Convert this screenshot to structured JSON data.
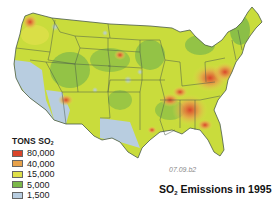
{
  "legend": {
    "title_prefix": "TONS SO",
    "title_sub": "2",
    "items": [
      {
        "label": "80,000",
        "color": "#d9452a"
      },
      {
        "label": "40,000",
        "color": "#e8a24a"
      },
      {
        "label": "15,000",
        "color": "#dfe04a"
      },
      {
        "label": "5,000",
        "color": "#7cb84a"
      },
      {
        "label": "1,500",
        "color": "#b8cde0"
      }
    ]
  },
  "figure_code": "07.09.b2",
  "title": {
    "prefix": "SO",
    "sub": "2",
    "suffix": " Emissions in 1995"
  },
  "colors": {
    "high": "#d9452a",
    "mid_high": "#e8a24a",
    "mid": "#dfe04a",
    "low": "#7cb84a",
    "lowest": "#b8cde0",
    "border": "#4a5a4a"
  }
}
